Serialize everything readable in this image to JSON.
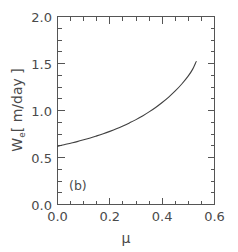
{
  "chart_data": {
    "type": "line",
    "title": "",
    "subtitle": "",
    "panel_label": "(b)",
    "xlabel": "μ",
    "ylabel": "Wₑ [ m/day ]",
    "ylabel_base": "W",
    "ylabel_sub": "e",
    "ylabel_units": "[ m/day ]",
    "xlim": [
      0.0,
      0.6
    ],
    "ylim": [
      0.0,
      2.0
    ],
    "xticks": [
      0.0,
      0.2,
      0.4,
      0.6
    ],
    "xticklabels": [
      "0.0",
      "0.2",
      "0.4",
      "0.6"
    ],
    "yticks": [
      0.0,
      0.5,
      1.0,
      1.5,
      2.0
    ],
    "yticklabels": [
      "0.0",
      "0.5",
      "1.0",
      "1.5",
      "2.0"
    ],
    "x_minor_interval": 0.05,
    "y_minor_interval": 0.125,
    "grid": false,
    "legend": null,
    "legend_position": "none",
    "line_color": "#404040",
    "axis_color": "#555555",
    "background_color": "#ffffff",
    "series": [
      {
        "name": "We",
        "x": [
          0.0,
          0.025,
          0.05,
          0.075,
          0.1,
          0.125,
          0.15,
          0.175,
          0.2,
          0.225,
          0.25,
          0.275,
          0.3,
          0.325,
          0.35,
          0.375,
          0.4,
          0.425,
          0.45,
          0.475,
          0.5,
          0.515,
          0.53
        ],
        "y": [
          0.62,
          0.635,
          0.652,
          0.669,
          0.688,
          0.708,
          0.73,
          0.753,
          0.778,
          0.805,
          0.835,
          0.868,
          0.903,
          0.942,
          0.985,
          1.032,
          1.085,
          1.143,
          1.208,
          1.282,
          1.368,
          1.432,
          1.52
        ]
      }
    ]
  }
}
